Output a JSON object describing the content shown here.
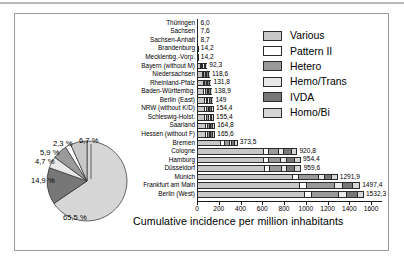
{
  "chart_data": [
    {
      "type": "bar",
      "orientation": "horizontal",
      "stacked": true,
      "title": "",
      "xlabel": "Cumulative incidence per million inhabitants",
      "ylabel": "",
      "xlim": [
        0,
        1700
      ],
      "xticks": [
        0,
        200,
        400,
        600,
        800,
        1000,
        1200,
        1400,
        1600
      ],
      "xticklabels": [
        "0",
        "200",
        "400",
        "600",
        "800",
        "1000",
        "1200",
        "1400",
        "1600"
      ],
      "grid": false,
      "legend_position": "upper right",
      "series_names": [
        "Various",
        "Pattern II",
        "Hetero",
        "Hemo/Trans",
        "IVDA",
        "Homo/Bi"
      ],
      "categories": [
        "Thüringen",
        "Sachsen",
        "Sachsen-Anhalt",
        "Brandenburg",
        "Mecklenbg.-Vorp.",
        "Bayern (without M)",
        "Niedersachsen",
        "Rheinland-Pfalz",
        "Baden-Württembg.",
        "Berlin (East)",
        "NRW (without K/D)",
        "Schleswig-Holst.",
        "Saarland",
        "Hessen (without F)",
        "Bremen",
        "Cologne",
        "Hamburg",
        "Düsseldorf",
        "Munich",
        "Frankfurt am Main",
        "Berlin (West)"
      ],
      "value_labels": [
        "6,0",
        "7,6",
        "8,7",
        "14,2",
        "14,2",
        "92,3",
        "118,6",
        "131,8",
        "138,9",
        "149",
        "154,4",
        "155,4",
        "164,8",
        "165,6",
        "373,5",
        "920,8",
        "954,4",
        "959,6",
        "1291,9",
        "1497,4",
        "1532,3"
      ],
      "totals": [
        6.0,
        7.6,
        8.7,
        14.2,
        14.2,
        92.3,
        118.6,
        131.8,
        138.9,
        149,
        154.4,
        155.4,
        164.8,
        165.6,
        373.5,
        920.8,
        954.4,
        959.6,
        1291.9,
        1497.4,
        1532.3
      ],
      "segments": [
        [
          4.0,
          0.4,
          0.5,
          0.3,
          0.4,
          0.4
        ],
        [
          5.0,
          0.5,
          0.7,
          0.4,
          0.5,
          0.5
        ],
        [
          5.7,
          0.6,
          0.8,
          0.4,
          0.6,
          0.6
        ],
        [
          9.3,
          1.0,
          1.3,
          0.7,
          1.0,
          0.9
        ],
        [
          9.3,
          1.0,
          1.3,
          0.7,
          1.0,
          0.9
        ],
        [
          60.5,
          6.5,
          8.3,
          4.3,
          7.0,
          5.7
        ],
        [
          77.7,
          8.3,
          10.7,
          5.6,
          9.0,
          7.3
        ],
        [
          86.3,
          9.2,
          11.9,
          6.2,
          10.0,
          8.2
        ],
        [
          91.0,
          9.7,
          12.5,
          6.5,
          10.5,
          8.7
        ],
        [
          97.6,
          10.4,
          13.4,
          7.0,
          11.3,
          9.3
        ],
        [
          101.1,
          10.8,
          13.9,
          7.2,
          11.7,
          9.7
        ],
        [
          101.8,
          10.9,
          14.0,
          7.3,
          11.8,
          9.6
        ],
        [
          107.9,
          11.5,
          14.8,
          7.7,
          12.5,
          10.4
        ],
        [
          108.5,
          11.6,
          14.9,
          7.8,
          12.6,
          10.2
        ],
        [
          247.0,
          26.0,
          46.0,
          17.0,
          24.0,
          13.5
        ],
        [
          640.0,
          39.0,
          94.0,
          41.0,
          66.0,
          40.8
        ],
        [
          641.0,
          40.0,
          110.0,
          42.0,
          75.0,
          46.4
        ],
        [
          648.0,
          40.0,
          106.0,
          42.0,
          75.0,
          48.6
        ],
        [
          910.0,
          50.0,
          185.0,
          46.0,
          60.0,
          40.9
        ],
        [
          970.0,
          55.0,
          260.0,
          70.0,
          90.0,
          52.4
        ],
        [
          1020.0,
          58.0,
          250.0,
          60.0,
          100.0,
          44.3
        ]
      ]
    },
    {
      "type": "pie",
      "title": "",
      "labels": [
        "Homo/Bi",
        "IVDA",
        "Hemo/Trans",
        "Hetero",
        "Pattern II",
        "Various"
      ],
      "values": [
        65.5,
        14.9,
        4.7,
        5.9,
        2.3,
        6.7
      ],
      "value_labels": [
        "65,5 %",
        "14,9 %",
        "4,7 %",
        "5,9 %",
        "2,3 %",
        "6,7 %"
      ]
    }
  ],
  "legend": {
    "items": [
      {
        "label": "Various",
        "color": "#c8c8c8"
      },
      {
        "label": "Pattern II",
        "color": "#ffffff"
      },
      {
        "label": "Hetero",
        "color": "#9a9a9a"
      },
      {
        "label": "Hemo/Trans",
        "color": "#e8e8e8"
      },
      {
        "label": "IVDA",
        "color": "#777777"
      },
      {
        "label": "Homo/Bi",
        "color": "#d6d6d6"
      }
    ]
  },
  "axis": {
    "xtitle": "Cumulative incidence per million inhabitants",
    "ticklabels": [
      "0",
      "200",
      "400",
      "600",
      "800",
      "1000",
      "1200",
      "1400",
      "1600"
    ]
  },
  "colors": {
    "various": "#c8c8c8",
    "pattern_ii": "#ffffff",
    "hetero": "#9a9a9a",
    "hemo_trans": "#e8e8e8",
    "ivda": "#777777",
    "homo_bi": "#d6d6d6",
    "outline": "#2b2b2b",
    "frame": "#9a9a9a",
    "background": "#ffffff"
  }
}
